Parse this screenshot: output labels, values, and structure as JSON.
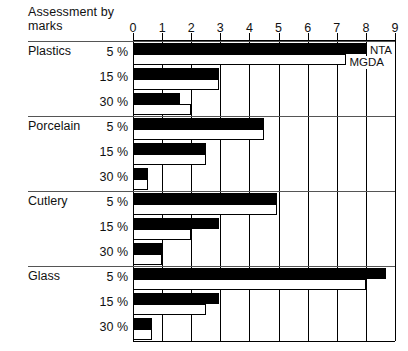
{
  "chart_data": {
    "type": "bar",
    "orientation": "horizontal",
    "title": "Assessment by\nmarks",
    "xlabel": "",
    "ylabel": "",
    "xlim": [
      0,
      9
    ],
    "xticks": [
      0,
      1,
      2,
      3,
      4,
      5,
      6,
      7,
      8,
      9
    ],
    "xtick_labels": [
      "0",
      "1",
      "2",
      "3",
      "4",
      "5",
      "6",
      "7",
      "8",
      "9"
    ],
    "grid": true,
    "legend_position": "inline-annotation",
    "series": [
      {
        "name": "NTA",
        "fill": "black",
        "color": "#000000"
      },
      {
        "name": "MGDA",
        "fill": "white",
        "color": "#ffffff"
      }
    ],
    "annotations": [
      {
        "text": "NTA",
        "group": "Plastics",
        "level": "5 %"
      },
      {
        "text": "MGDA",
        "group": "Plastics",
        "level": "5 %"
      }
    ],
    "groups": [
      {
        "name": "Plastics",
        "levels": [
          {
            "label": "5 %",
            "NTA": 8.0,
            "MGDA": 7.3
          },
          {
            "label": "15 %",
            "NTA": 2.95,
            "MGDA": 2.95
          },
          {
            "label": "30 %",
            "NTA": 1.6,
            "MGDA": 2.0
          }
        ]
      },
      {
        "name": "Porcelain",
        "levels": [
          {
            "label": "5 %",
            "NTA": 4.5,
            "MGDA": 4.5
          },
          {
            "label": "15 %",
            "NTA": 2.5,
            "MGDA": 2.5
          },
          {
            "label": "30 %",
            "NTA": 0.5,
            "MGDA": 0.5
          }
        ]
      },
      {
        "name": "Cutlery",
        "levels": [
          {
            "label": "5 %",
            "NTA": 4.95,
            "MGDA": 4.95
          },
          {
            "label": "15 %",
            "NTA": 2.95,
            "MGDA": 2.0
          },
          {
            "label": "30 %",
            "NTA": 1.0,
            "MGDA": 1.0
          }
        ]
      },
      {
        "name": "Glass",
        "levels": [
          {
            "label": "5 %",
            "NTA": 8.7,
            "MGDA": 8.0
          },
          {
            "label": "15 %",
            "NTA": 2.95,
            "MGDA": 2.5
          },
          {
            "label": "30 %",
            "NTA": 0.65,
            "MGDA": 0.65
          }
        ]
      }
    ]
  },
  "colors": {
    "nta_fill": "#000000",
    "mgda_fill": "#ffffff",
    "stroke": "#000000",
    "rule": "#555555",
    "background": "#ffffff"
  }
}
